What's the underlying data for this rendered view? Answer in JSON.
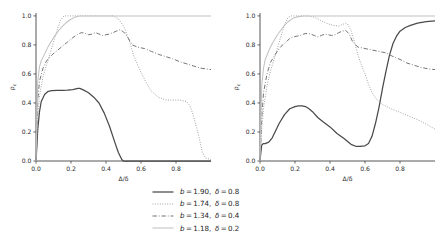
{
  "figure": {
    "title": "",
    "panel_count": 2
  },
  "axes": {
    "xlabel_main": "Δ/",
    "xlabel_delta": "δ",
    "ylabel_main": "ρ",
    "ylabel_sub": "c",
    "xticks": [
      "0.0",
      "0.2",
      "0.4",
      "0.6",
      "0.8"
    ],
    "xtick_values": [
      0.0,
      0.2,
      0.4,
      0.6,
      0.8
    ],
    "yticks": [
      "0.0",
      "0.2",
      "0.4",
      "0.6",
      "0.8",
      "1.0"
    ],
    "ytick_values": [
      0.0,
      0.2,
      0.4,
      0.6,
      0.8,
      1.0
    ],
    "xlim": [
      0.0,
      1.0
    ],
    "ylim": [
      0.0,
      1.02
    ],
    "grid": false
  },
  "legend": {
    "position": "below-center",
    "entries": [
      {
        "label": "b = 1.90,  δ = 0.8",
        "b": "1.90",
        "delta": "0.8",
        "style": "solid",
        "color": "#4a4a4a",
        "width": 1.25
      },
      {
        "label": "b = 1.74,  δ = 0.8",
        "b": "1.74",
        "delta": "0.8",
        "style": "dotted",
        "color": "#8f8f8f",
        "width": 0.95
      },
      {
        "label": "b = 1.34,  δ = 0.4",
        "b": "1.34",
        "delta": "0.4",
        "style": "dashdot",
        "color": "#6d6d6d",
        "width": 0.95
      },
      {
        "label": "b = 1.18,  δ = 0.2",
        "b": "1.18",
        "delta": "0.2",
        "style": "solid",
        "color": "#c2c2c2",
        "width": 1.05
      }
    ]
  },
  "chart_data": {
    "type": "line",
    "title": "",
    "xlabel": "Δ/δ",
    "ylabel": "ρ_c",
    "xlim": [
      0.0,
      1.0
    ],
    "ylim": [
      0.0,
      1.02
    ],
    "grid": false,
    "panels": [
      {
        "name": "left-panel",
        "series": [
          {
            "name": "b = 1.90, δ = 0.8",
            "style": "solid",
            "color": "#4a4a4a",
            "x": [
              0.0,
              0.005,
              0.01,
              0.02,
              0.03,
              0.05,
              0.07,
              0.09,
              0.12,
              0.15,
              0.18,
              0.21,
              0.24,
              0.25,
              0.27,
              0.3,
              0.33,
              0.36,
              0.39,
              0.42,
              0.45,
              0.47,
              0.49,
              0.5,
              0.55,
              0.6,
              0.7,
              0.8,
              0.9,
              1.0
            ],
            "y": [
              0.0,
              0.1,
              0.22,
              0.34,
              0.41,
              0.46,
              0.48,
              0.485,
              0.487,
              0.487,
              0.488,
              0.492,
              0.5,
              0.5,
              0.49,
              0.47,
              0.44,
              0.4,
              0.33,
              0.24,
              0.13,
              0.06,
              0.01,
              0.0,
              0.0,
              0.0,
              0.0,
              0.0,
              0.0,
              0.0
            ]
          },
          {
            "name": "b = 1.74, δ = 0.8",
            "style": "dotted",
            "color": "#8f8f8f",
            "x": [
              0.0,
              0.01,
              0.02,
              0.04,
              0.06,
              0.08,
              0.1,
              0.12,
              0.14,
              0.16,
              0.2,
              0.25,
              0.3,
              0.35,
              0.4,
              0.44,
              0.47,
              0.5,
              0.53,
              0.56,
              0.6,
              0.63,
              0.66,
              0.7,
              0.74,
              0.78,
              0.82,
              0.86,
              0.88,
              0.9,
              0.92,
              0.94,
              0.95,
              0.97,
              1.0
            ],
            "y": [
              0.0,
              0.3,
              0.45,
              0.58,
              0.66,
              0.74,
              0.82,
              0.9,
              0.97,
              1.0,
              1.0,
              1.0,
              1.0,
              1.0,
              1.0,
              1.0,
              0.98,
              0.93,
              0.84,
              0.72,
              0.61,
              0.54,
              0.48,
              0.44,
              0.42,
              0.42,
              0.42,
              0.41,
              0.38,
              0.31,
              0.22,
              0.12,
              0.06,
              0.02,
              0.01
            ]
          },
          {
            "name": "b = 1.34, δ = 0.4",
            "style": "dashdot",
            "color": "#6d6d6d",
            "x": [
              0.0,
              0.01,
              0.02,
              0.04,
              0.06,
              0.09,
              0.12,
              0.15,
              0.18,
              0.21,
              0.24,
              0.26,
              0.28,
              0.3,
              0.32,
              0.34,
              0.36,
              0.38,
              0.4,
              0.42,
              0.44,
              0.46,
              0.48,
              0.5,
              0.52,
              0.55,
              0.58,
              0.62,
              0.66,
              0.7,
              0.74,
              0.78,
              0.82,
              0.86,
              0.9,
              0.94,
              1.0
            ],
            "y": [
              0.0,
              0.42,
              0.55,
              0.64,
              0.69,
              0.73,
              0.76,
              0.79,
              0.82,
              0.85,
              0.875,
              0.885,
              0.88,
              0.87,
              0.875,
              0.885,
              0.875,
              0.865,
              0.87,
              0.875,
              0.885,
              0.895,
              0.905,
              0.89,
              0.86,
              0.8,
              0.785,
              0.775,
              0.755,
              0.735,
              0.72,
              0.705,
              0.685,
              0.67,
              0.655,
              0.64,
              0.63
            ]
          },
          {
            "name": "b = 1.18, δ = 0.2",
            "style": "solid",
            "color": "#c2c2c2",
            "x": [
              0.0,
              0.01,
              0.02,
              0.03,
              0.05,
              0.07,
              0.1,
              0.13,
              0.16,
              0.19,
              0.22,
              0.25,
              0.28,
              0.3,
              0.4,
              0.5,
              0.6,
              0.7,
              0.8,
              0.9,
              1.0
            ],
            "y": [
              0.0,
              0.55,
              0.65,
              0.69,
              0.74,
              0.79,
              0.85,
              0.9,
              0.94,
              0.97,
              0.99,
              1.0,
              1.0,
              1.0,
              1.0,
              1.0,
              1.0,
              1.0,
              1.0,
              1.0,
              1.0
            ]
          }
        ]
      },
      {
        "name": "right-panel",
        "series": [
          {
            "name": "b = 1.90, δ = 0.8",
            "style": "solid",
            "color": "#4a4a4a",
            "x": [
              0.0,
              0.005,
              0.01,
              0.02,
              0.03,
              0.05,
              0.07,
              0.09,
              0.11,
              0.14,
              0.17,
              0.2,
              0.22,
              0.24,
              0.26,
              0.28,
              0.3,
              0.33,
              0.36,
              0.4,
              0.44,
              0.48,
              0.52,
              0.55,
              0.57,
              0.6,
              0.62,
              0.64,
              0.66,
              0.68,
              0.7,
              0.72,
              0.74,
              0.76,
              0.78,
              0.8,
              0.83,
              0.86,
              0.9,
              0.95,
              1.0
            ],
            "y": [
              0.0,
              0.06,
              0.11,
              0.12,
              0.12,
              0.13,
              0.16,
              0.21,
              0.26,
              0.32,
              0.36,
              0.375,
              0.38,
              0.38,
              0.375,
              0.36,
              0.34,
              0.3,
              0.27,
              0.235,
              0.19,
              0.155,
              0.115,
              0.1,
              0.1,
              0.105,
              0.12,
              0.17,
              0.26,
              0.37,
              0.5,
              0.62,
              0.73,
              0.81,
              0.86,
              0.895,
              0.92,
              0.935,
              0.95,
              0.96,
              0.965
            ]
          },
          {
            "name": "b = 1.74, δ = 0.8",
            "style": "dotted",
            "color": "#8f8f8f",
            "x": [
              0.0,
              0.01,
              0.02,
              0.04,
              0.06,
              0.08,
              0.1,
              0.12,
              0.14,
              0.16,
              0.18,
              0.21,
              0.24,
              0.27,
              0.3,
              0.33,
              0.36,
              0.39,
              0.42,
              0.45,
              0.47,
              0.49,
              0.5,
              0.52,
              0.54,
              0.56,
              0.58,
              0.6,
              0.62,
              0.64,
              0.67,
              0.7,
              0.74,
              0.78,
              0.82,
              0.86,
              0.9,
              0.94,
              0.97,
              1.0
            ],
            "y": [
              0.0,
              0.22,
              0.36,
              0.52,
              0.62,
              0.7,
              0.78,
              0.86,
              0.94,
              0.99,
              1.0,
              1.0,
              1.0,
              1.0,
              0.995,
              0.98,
              0.96,
              0.945,
              0.935,
              0.93,
              0.94,
              0.95,
              0.945,
              0.9,
              0.82,
              0.73,
              0.66,
              0.6,
              0.53,
              0.47,
              0.42,
              0.39,
              0.365,
              0.345,
              0.325,
              0.305,
              0.285,
              0.26,
              0.24,
              0.22
            ]
          },
          {
            "name": "b = 1.34, δ = 0.4",
            "style": "dashdot",
            "color": "#6d6d6d",
            "x": [
              0.0,
              0.01,
              0.02,
              0.04,
              0.06,
              0.09,
              0.12,
              0.15,
              0.17,
              0.19,
              0.21,
              0.23,
              0.25,
              0.27,
              0.29,
              0.31,
              0.33,
              0.35,
              0.37,
              0.39,
              0.41,
              0.43,
              0.45,
              0.47,
              0.49,
              0.51,
              0.53,
              0.56,
              0.6,
              0.64,
              0.68,
              0.72,
              0.76,
              0.8,
              0.84,
              0.88,
              0.92,
              0.96,
              1.0
            ],
            "y": [
              0.0,
              0.3,
              0.47,
              0.6,
              0.68,
              0.74,
              0.79,
              0.82,
              0.845,
              0.855,
              0.86,
              0.865,
              0.875,
              0.88,
              0.875,
              0.865,
              0.855,
              0.865,
              0.875,
              0.87,
              0.865,
              0.87,
              0.885,
              0.895,
              0.9,
              0.875,
              0.82,
              0.785,
              0.775,
              0.765,
              0.755,
              0.745,
              0.72,
              0.7,
              0.675,
              0.66,
              0.645,
              0.635,
              0.63
            ]
          },
          {
            "name": "b = 1.18, δ = 0.2",
            "style": "solid",
            "color": "#c2c2c2",
            "x": [
              0.0,
              0.01,
              0.02,
              0.03,
              0.05,
              0.07,
              0.1,
              0.13,
              0.16,
              0.19,
              0.22,
              0.25,
              0.28,
              0.32,
              0.4,
              0.5,
              0.6,
              0.7,
              0.8,
              0.9,
              1.0
            ],
            "y": [
              0.0,
              0.52,
              0.64,
              0.7,
              0.76,
              0.81,
              0.87,
              0.92,
              0.96,
              0.985,
              0.995,
              1.0,
              1.0,
              1.0,
              1.0,
              1.0,
              1.0,
              1.0,
              1.0,
              1.0,
              1.0
            ]
          }
        ]
      }
    ]
  }
}
